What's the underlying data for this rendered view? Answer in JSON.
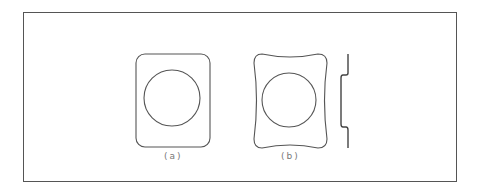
{
  "figure": {
    "panels": [
      {
        "id": "a",
        "label": "(a)",
        "shape": "rounded-rectangle-with-circle"
      },
      {
        "id": "b",
        "label": "(b)",
        "shape": "concave-sided-square-with-circle"
      }
    ],
    "side_profile": {
      "shape": "stepped-profile-line"
    },
    "colors": {
      "stroke": "#555555",
      "frame": "#555555",
      "background": "#ffffff",
      "label": "#777777"
    }
  }
}
